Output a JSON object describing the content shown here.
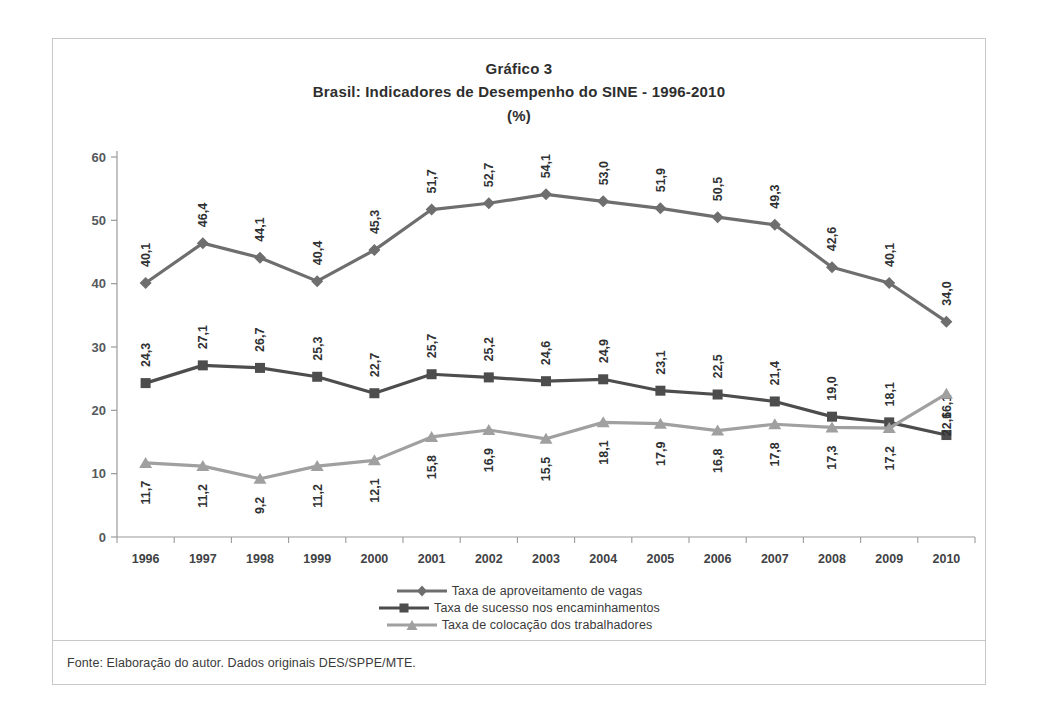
{
  "figure": {
    "title_line1": "Gráfico 3",
    "title_line2": "Brasil: Indicadores de Desempenho do SINE - 1996-2010",
    "title_line3": "(%)",
    "source": "Fonte: Elaboração do autor. Dados originais DES/SPPE/MTE."
  },
  "colors": {
    "series1": "#6e6e6e",
    "series2": "#4d4d4d",
    "series3": "#a0a0a0",
    "frame": "#c8c8c8",
    "axis": "#9a9a9a",
    "text": "#3a3a3a"
  },
  "chart_data": {
    "type": "line",
    "title": "Brasil: Indicadores de Desempenho do SINE - 1996-2010 (%)",
    "xlabel": "",
    "ylabel": "(%)",
    "ylim": [
      0,
      60
    ],
    "yticks": [
      "0",
      "10",
      "20",
      "30",
      "40",
      "50",
      "60"
    ],
    "grid": false,
    "legend_position": "bottom",
    "categories": [
      "1996",
      "1997",
      "1998",
      "1999",
      "2000",
      "2001",
      "2002",
      "2003",
      "2004",
      "2005",
      "2006",
      "2007",
      "2008",
      "2009",
      "2010"
    ],
    "series": [
      {
        "name": "Taxa de aproveitamento de vagas",
        "marker": "diamond",
        "color": "#6e6e6e",
        "values": [
          40.1,
          46.4,
          44.1,
          40.4,
          45.3,
          51.7,
          52.7,
          54.1,
          53.0,
          51.9,
          50.5,
          49.3,
          42.6,
          40.1,
          34.0
        ],
        "labels": [
          "40,1",
          "46,4",
          "44,1",
          "40,4",
          "45,3",
          "51,7",
          "52,7",
          "54,1",
          "53,0",
          "51,9",
          "50,5",
          "49,3",
          "42,6",
          "40,1",
          "34,0"
        ]
      },
      {
        "name": "Taxa de sucesso nos encaminhamentos",
        "marker": "square",
        "color": "#4d4d4d",
        "values": [
          24.3,
          27.1,
          26.7,
          25.3,
          22.7,
          25.7,
          25.2,
          24.6,
          24.9,
          23.1,
          22.5,
          21.4,
          19.0,
          18.1,
          16.1
        ],
        "labels": [
          "24,3",
          "27,1",
          "26,7",
          "25,3",
          "22,7",
          "25,7",
          "25,2",
          "24,6",
          "24,9",
          "23,1",
          "22,5",
          "21,4",
          "19,0",
          "18,1",
          "16,1"
        ]
      },
      {
        "name": "Taxa de colocação dos trabalhadores",
        "marker": "triangle",
        "color": "#a0a0a0",
        "values": [
          11.7,
          11.2,
          9.2,
          11.2,
          12.1,
          15.8,
          16.9,
          15.5,
          18.1,
          17.9,
          16.8,
          17.8,
          17.3,
          17.2,
          22.6
        ],
        "labels": [
          "11,7",
          "11,2",
          "9,2",
          "11,2",
          "12,1",
          "15,8",
          "16,9",
          "15,5",
          "18,1",
          "17,9",
          "16,8",
          "17,8",
          "17,3",
          "17,2",
          "22,6"
        ]
      }
    ]
  }
}
